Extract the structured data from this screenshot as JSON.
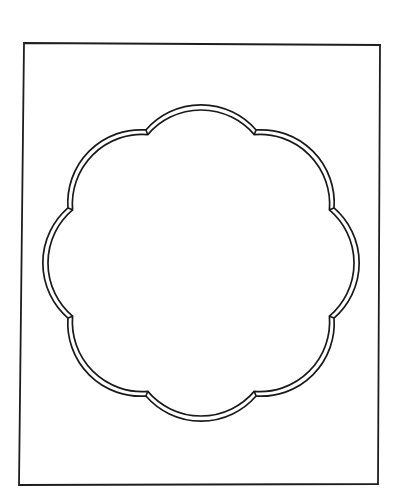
{
  "figure": {
    "background": "#ffffff",
    "ink_color": "#1a1a1a",
    "canvas": {
      "width": 394,
      "height": 499
    }
  },
  "frame": {
    "corners": [
      [
        24,
        43
      ],
      [
        380,
        45
      ],
      [
        378,
        484
      ],
      [
        19,
        485
      ]
    ],
    "stroke_width": 1.8
  },
  "scallop": {
    "center": [
      201,
      263
    ],
    "lobe_count": 8,
    "first_cusp_angle_deg": -112.5,
    "outer": {
      "cusp_radius": 144,
      "arc_radius": 73
    },
    "inner": {
      "cusp_radius": 139,
      "arc_radius": 69.8
    },
    "stroke_width": 1.7,
    "cusps_observed": [
      [
        147,
        131
      ],
      [
        261,
        133
      ],
      [
        338,
        209
      ],
      [
        335,
        317
      ],
      [
        258,
        392
      ],
      [
        143,
        393
      ],
      [
        65,
        318
      ],
      [
        67,
        207
      ]
    ]
  }
}
